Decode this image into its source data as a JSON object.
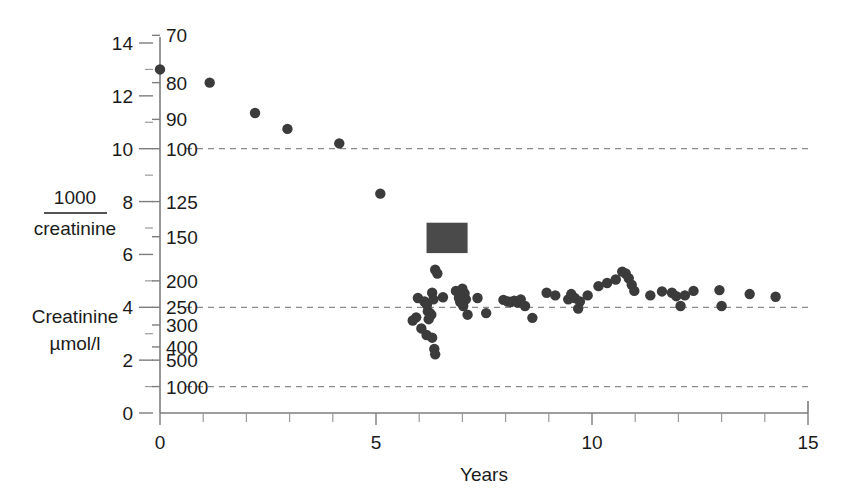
{
  "chart_data": {
    "type": "scatter",
    "title": "",
    "xlabel": "Years",
    "ylabel_left_numerator": "1000",
    "ylabel_left_denominator": "creatinine",
    "ylabel_right_line1": "Creatinine",
    "ylabel_right_line2": "µmol/l",
    "xlim": [
      0,
      15
    ],
    "ylim": [
      0,
      14
    ],
    "x_ticks_major": [
      0,
      5,
      10,
      15
    ],
    "x_ticks_minor": [
      1,
      2,
      3,
      4,
      6,
      7,
      8,
      9,
      11,
      12,
      13,
      14
    ],
    "x_tick_labels": [
      "0",
      "5",
      "10",
      "15"
    ],
    "y_ticks_major": [
      0,
      2,
      4,
      6,
      8,
      10,
      12,
      14
    ],
    "y_ticks_minor": [
      1,
      3,
      5,
      7,
      9,
      11,
      13
    ],
    "y_tick_labels": [
      "0",
      "2",
      "4",
      "6",
      "8",
      "10",
      "12",
      "14"
    ],
    "secondary_axis": {
      "label": "Creatinine µmol/l",
      "note": "reciprocal scale, value = 1000 / y",
      "ticks": [
        {
          "creatinine": "70",
          "y": 14.29
        },
        {
          "creatinine": "80",
          "y": 12.5
        },
        {
          "creatinine": "90",
          "y": 11.11
        },
        {
          "creatinine": "100",
          "y": 10.0
        },
        {
          "creatinine": "125",
          "y": 8.0
        },
        {
          "creatinine": "150",
          "y": 6.67
        },
        {
          "creatinine": "200",
          "y": 5.0
        },
        {
          "creatinine": "250",
          "y": 4.0
        },
        {
          "creatinine": "300",
          "y": 3.33
        },
        {
          "creatinine": "400",
          "y": 2.5
        },
        {
          "creatinine": "500",
          "y": 2.0
        },
        {
          "creatinine": "1000",
          "y": 1.0
        }
      ]
    },
    "gridlines": [
      {
        "y": 10.0,
        "label": "100",
        "style": "dashed"
      },
      {
        "y": 4.0,
        "label": "250",
        "style": "dashed"
      },
      {
        "y": 1.0,
        "label": "1000",
        "style": "dashed"
      }
    ],
    "grid": "horizontal-dashed",
    "legend": "none",
    "marker_color": "#3b3b3b",
    "annotation": {
      "name": "treatment-period-block",
      "shape": "rectangle",
      "color": "#4a4a4a",
      "x_start": 6.17,
      "x_end": 7.12,
      "y_bottom": 6.05,
      "y_top": 7.2
    },
    "points": [
      {
        "x": 0.0,
        "y": 13.0
      },
      {
        "x": 1.15,
        "y": 12.5
      },
      {
        "x": 2.2,
        "y": 11.35
      },
      {
        "x": 2.95,
        "y": 10.75
      },
      {
        "x": 4.15,
        "y": 10.2
      },
      {
        "x": 5.1,
        "y": 8.3
      },
      {
        "x": 6.37,
        "y": 5.42
      },
      {
        "x": 6.42,
        "y": 5.28
      },
      {
        "x": 5.97,
        "y": 4.35
      },
      {
        "x": 5.93,
        "y": 3.62
      },
      {
        "x": 5.85,
        "y": 3.5
      },
      {
        "x": 6.05,
        "y": 3.2
      },
      {
        "x": 6.12,
        "y": 4.22
      },
      {
        "x": 6.18,
        "y": 4.1
      },
      {
        "x": 6.2,
        "y": 3.85
      },
      {
        "x": 6.25,
        "y": 3.78
      },
      {
        "x": 6.28,
        "y": 3.72
      },
      {
        "x": 6.22,
        "y": 3.55
      },
      {
        "x": 6.3,
        "y": 4.55
      },
      {
        "x": 6.33,
        "y": 4.3
      },
      {
        "x": 6.17,
        "y": 2.95
      },
      {
        "x": 6.3,
        "y": 2.85
      },
      {
        "x": 6.35,
        "y": 2.42
      },
      {
        "x": 6.37,
        "y": 2.22
      },
      {
        "x": 6.55,
        "y": 4.38
      },
      {
        "x": 6.85,
        "y": 4.62
      },
      {
        "x": 6.92,
        "y": 4.35
      },
      {
        "x": 6.95,
        "y": 4.2
      },
      {
        "x": 7.0,
        "y": 4.7
      },
      {
        "x": 7.05,
        "y": 4.52
      },
      {
        "x": 7.08,
        "y": 4.3
      },
      {
        "x": 7.02,
        "y": 4.05
      },
      {
        "x": 7.12,
        "y": 3.72
      },
      {
        "x": 7.35,
        "y": 4.35
      },
      {
        "x": 7.55,
        "y": 3.78
      },
      {
        "x": 7.95,
        "y": 4.28
      },
      {
        "x": 8.05,
        "y": 4.22
      },
      {
        "x": 8.12,
        "y": 4.2
      },
      {
        "x": 8.2,
        "y": 4.25
      },
      {
        "x": 8.28,
        "y": 4.18
      },
      {
        "x": 8.35,
        "y": 4.3
      },
      {
        "x": 8.45,
        "y": 4.05
      },
      {
        "x": 8.62,
        "y": 3.6
      },
      {
        "x": 8.95,
        "y": 4.55
      },
      {
        "x": 9.15,
        "y": 4.45
      },
      {
        "x": 9.45,
        "y": 4.3
      },
      {
        "x": 9.52,
        "y": 4.5
      },
      {
        "x": 9.6,
        "y": 4.35
      },
      {
        "x": 9.72,
        "y": 4.22
      },
      {
        "x": 9.68,
        "y": 3.95
      },
      {
        "x": 9.9,
        "y": 4.45
      },
      {
        "x": 10.15,
        "y": 4.8
      },
      {
        "x": 10.35,
        "y": 4.92
      },
      {
        "x": 10.55,
        "y": 5.05
      },
      {
        "x": 10.7,
        "y": 5.35
      },
      {
        "x": 10.78,
        "y": 5.28
      },
      {
        "x": 10.85,
        "y": 5.1
      },
      {
        "x": 10.92,
        "y": 4.85
      },
      {
        "x": 10.98,
        "y": 4.62
      },
      {
        "x": 11.35,
        "y": 4.45
      },
      {
        "x": 11.62,
        "y": 4.6
      },
      {
        "x": 11.85,
        "y": 4.55
      },
      {
        "x": 11.95,
        "y": 4.42
      },
      {
        "x": 12.05,
        "y": 4.05
      },
      {
        "x": 12.15,
        "y": 4.45
      },
      {
        "x": 12.35,
        "y": 4.62
      },
      {
        "x": 12.95,
        "y": 4.65
      },
      {
        "x": 13.0,
        "y": 4.05
      },
      {
        "x": 13.65,
        "y": 4.5
      },
      {
        "x": 14.25,
        "y": 4.4
      }
    ]
  }
}
